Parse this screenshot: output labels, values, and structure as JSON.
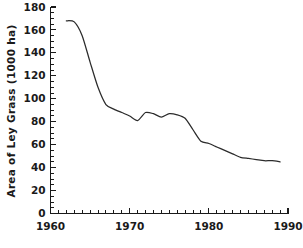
{
  "chart_data": {
    "type": "line",
    "title": "",
    "subtitle": "",
    "xlabel": "",
    "ylabel": "Area of Ley Grass (1000 ha)",
    "xlim": [
      1960,
      1990
    ],
    "ylim": [
      0,
      180
    ],
    "grid": false,
    "legend": null,
    "x_major_ticks": [
      1960,
      1970,
      1980,
      1990
    ],
    "x_tick_labels": [
      "1960",
      "1970",
      "1980",
      "1990"
    ],
    "x_minor_tick_step": 1,
    "y_major_ticks": [
      0,
      20,
      40,
      60,
      80,
      100,
      120,
      140,
      160,
      180
    ],
    "y_tick_labels": [
      "0",
      "20",
      "40",
      "60",
      "80",
      "100",
      "120",
      "140",
      "160",
      "180"
    ],
    "y_minor_tick_step": 5,
    "line_color": "#2b2b2b",
    "series": [
      {
        "name": "Area of Ley Grass",
        "x": [
          1962,
          1963,
          1964,
          1965,
          1966,
          1967,
          1968,
          1969,
          1970,
          1971,
          1972,
          1973,
          1974,
          1975,
          1976,
          1977,
          1978,
          1979,
          1980,
          1981,
          1982,
          1983,
          1984,
          1985,
          1986,
          1987,
          1988,
          1989
        ],
        "values": [
          168,
          167,
          155,
          132,
          110,
          95,
          91,
          88,
          85,
          81,
          88,
          87,
          84,
          87,
          86,
          83,
          73,
          63,
          61,
          58,
          55,
          52,
          49,
          48,
          47,
          46,
          46,
          45
        ]
      }
    ]
  },
  "axis": {
    "y_title": "Area of Ley Grass (1000 ha)"
  }
}
